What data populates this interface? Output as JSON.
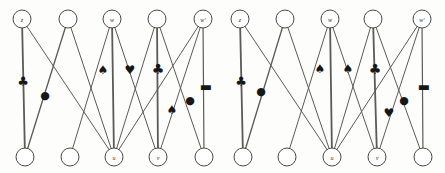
{
  "figure": {
    "width": 445,
    "height": 173,
    "background_color": "#fdfdfc",
    "edge_color": "#5a5a5a",
    "node_stroke_color": "#4a4a4a",
    "node_fill_color": "#ffffff",
    "marker_color": "#171717"
  },
  "panels": [
    {
      "id": "left-panel",
      "name": "left-diagram",
      "origin_x": 0,
      "top_nodes": [
        {
          "id": "t0",
          "label": "z",
          "cx": 22,
          "cy": 19,
          "r": 9
        },
        {
          "id": "t1",
          "label": "",
          "cx": 68,
          "cy": 19,
          "r": 9
        },
        {
          "id": "t2",
          "label": "w",
          "cx": 112,
          "cy": 19,
          "r": 9
        },
        {
          "id": "t3",
          "label": "",
          "cx": 157,
          "cy": 19,
          "r": 9
        },
        {
          "id": "t4",
          "label": "w'",
          "cx": 203,
          "cy": 19,
          "r": 9
        }
      ],
      "bottom_nodes": [
        {
          "id": "b0",
          "label": "",
          "cx": 25,
          "cy": 157,
          "r": 9
        },
        {
          "id": "b1",
          "label": "",
          "cx": 70,
          "cy": 157,
          "r": 9
        },
        {
          "id": "b2",
          "label": "u",
          "cx": 114,
          "cy": 157,
          "r": 9
        },
        {
          "id": "b3",
          "label": "v",
          "cx": 158,
          "cy": 157,
          "r": 9
        },
        {
          "id": "b4",
          "label": "",
          "cx": 204,
          "cy": 157,
          "r": 9
        }
      ],
      "edges": [
        {
          "from": "t0",
          "to": "b0",
          "weight": 1.8
        },
        {
          "from": "t0",
          "to": "b2",
          "weight": 1.0
        },
        {
          "from": "t1",
          "to": "b0",
          "weight": 1.4
        },
        {
          "from": "t1",
          "to": "b2",
          "weight": 1.0
        },
        {
          "from": "t2",
          "to": "b1",
          "weight": 1.0
        },
        {
          "from": "t2",
          "to": "b2",
          "weight": 1.8
        },
        {
          "from": "t2",
          "to": "b3",
          "weight": 1.0
        },
        {
          "from": "t3",
          "to": "b2",
          "weight": 1.0
        },
        {
          "from": "t3",
          "to": "b3",
          "weight": 1.8
        },
        {
          "from": "t3",
          "to": "b4",
          "weight": 1.0
        },
        {
          "from": "t4",
          "to": "b2",
          "weight": 1.0
        },
        {
          "from": "t4",
          "to": "b3",
          "weight": 1.0
        },
        {
          "from": "t4",
          "to": "b4",
          "weight": 1.2
        }
      ],
      "markers": [
        {
          "id": "m0",
          "glyph": "♣",
          "kind": "club-marker",
          "x": 23,
          "y": 81,
          "size": 13
        },
        {
          "id": "m1",
          "glyph": "●",
          "kind": "token-marker",
          "x": 45,
          "y": 95,
          "size": 11
        },
        {
          "id": "m2",
          "glyph": "♠",
          "kind": "spade-marker",
          "x": 103,
          "y": 70,
          "size": 12
        },
        {
          "id": "m3",
          "glyph": "♥",
          "kind": "heart-marker",
          "x": 130,
          "y": 70,
          "size": 12
        },
        {
          "id": "m4",
          "glyph": "♣",
          "kind": "club-marker",
          "x": 158,
          "y": 69,
          "size": 14
        },
        {
          "id": "m5",
          "glyph": "♠",
          "kind": "spade-marker",
          "x": 172,
          "y": 110,
          "size": 12
        },
        {
          "id": "m6",
          "glyph": "●",
          "kind": "token-marker",
          "x": 190,
          "y": 100,
          "size": 11
        },
        {
          "id": "m7",
          "glyph": "▬",
          "kind": "bar-marker",
          "x": 206,
          "y": 86,
          "size": 13
        }
      ]
    },
    {
      "id": "right-panel",
      "name": "right-diagram",
      "origin_x": 224,
      "top_nodes": [
        {
          "id": "t0",
          "label": "z",
          "cx": 240,
          "cy": 19,
          "r": 9
        },
        {
          "id": "t1",
          "label": "",
          "cx": 285,
          "cy": 19,
          "r": 9
        },
        {
          "id": "t2",
          "label": "w",
          "cx": 330,
          "cy": 19,
          "r": 9
        },
        {
          "id": "t3",
          "label": "",
          "cx": 373,
          "cy": 19,
          "r": 9
        },
        {
          "id": "t4",
          "label": "w'",
          "cx": 422,
          "cy": 19,
          "r": 9
        }
      ],
      "bottom_nodes": [
        {
          "id": "b0",
          "label": "",
          "cx": 243,
          "cy": 157,
          "r": 9
        },
        {
          "id": "b1",
          "label": "",
          "cx": 287,
          "cy": 157,
          "r": 9
        },
        {
          "id": "b2",
          "label": "u",
          "cx": 332,
          "cy": 157,
          "r": 9
        },
        {
          "id": "b3",
          "label": "v",
          "cx": 377,
          "cy": 157,
          "r": 9
        },
        {
          "id": "b4",
          "label": "",
          "cx": 423,
          "cy": 157,
          "r": 9
        }
      ],
      "edges": [
        {
          "from": "t0",
          "to": "b0",
          "weight": 1.8
        },
        {
          "from": "t0",
          "to": "b2",
          "weight": 1.0
        },
        {
          "from": "t1",
          "to": "b0",
          "weight": 1.4
        },
        {
          "from": "t1",
          "to": "b2",
          "weight": 1.0
        },
        {
          "from": "t2",
          "to": "b1",
          "weight": 1.0
        },
        {
          "from": "t2",
          "to": "b2",
          "weight": 1.8
        },
        {
          "from": "t2",
          "to": "b3",
          "weight": 1.0
        },
        {
          "from": "t3",
          "to": "b2",
          "weight": 1.0
        },
        {
          "from": "t3",
          "to": "b3",
          "weight": 1.8
        },
        {
          "from": "t3",
          "to": "b4",
          "weight": 1.0
        },
        {
          "from": "t4",
          "to": "b2",
          "weight": 1.0
        },
        {
          "from": "t4",
          "to": "b3",
          "weight": 1.0
        },
        {
          "from": "t4",
          "to": "b4",
          "weight": 1.2
        }
      ],
      "markers": [
        {
          "id": "m0",
          "glyph": "♣",
          "kind": "club-marker",
          "x": 241,
          "y": 81,
          "size": 13
        },
        {
          "id": "m1",
          "glyph": "●",
          "kind": "token-marker",
          "x": 261,
          "y": 91,
          "size": 11
        },
        {
          "id": "m2",
          "glyph": "♠",
          "kind": "spade-marker",
          "x": 320,
          "y": 69,
          "size": 12
        },
        {
          "id": "m3",
          "glyph": "♠",
          "kind": "spade-marker",
          "x": 348,
          "y": 69,
          "size": 12
        },
        {
          "id": "m4",
          "glyph": "♣",
          "kind": "club-marker",
          "x": 375,
          "y": 69,
          "size": 14
        },
        {
          "id": "m5",
          "glyph": "●",
          "kind": "token-marker",
          "x": 404,
          "y": 100,
          "size": 11
        },
        {
          "id": "m6",
          "glyph": "♥",
          "kind": "heart-marker",
          "x": 389,
          "y": 113,
          "size": 12
        },
        {
          "id": "m7",
          "glyph": "▬",
          "kind": "bar-marker",
          "x": 424,
          "y": 86,
          "size": 13
        }
      ]
    }
  ]
}
